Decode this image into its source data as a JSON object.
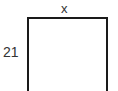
{
  "diagram": {
    "shape": "square",
    "top_label": "x",
    "side_label": "21",
    "stroke_color": "#1a1a1a"
  }
}
